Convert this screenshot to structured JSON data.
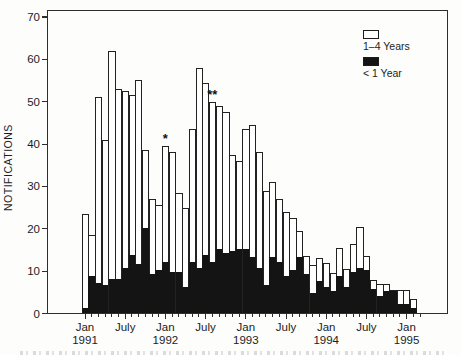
{
  "figure": {
    "background": "#fdfdfc"
  },
  "y_axis": {
    "label": "NOTIFICATIONS",
    "ticks": [
      0,
      10,
      20,
      30,
      40,
      50,
      60,
      70
    ],
    "min": 0,
    "max": 70
  },
  "x_axis": {
    "labeled_ticks": [
      {
        "index": 0,
        "line1": "Jan",
        "line2": "1991"
      },
      {
        "index": 6,
        "line1": "July",
        "line2": ""
      },
      {
        "index": 12,
        "line1": "Jan",
        "line2": "1992"
      },
      {
        "index": 18,
        "line1": "July",
        "line2": ""
      },
      {
        "index": 24,
        "line1": "Jan",
        "line2": "1993"
      },
      {
        "index": 30,
        "line1": "July",
        "line2": ""
      },
      {
        "index": 36,
        "line1": "Jan",
        "line2": "1994"
      },
      {
        "index": 42,
        "line1": "July",
        "line2": ""
      },
      {
        "index": 48,
        "line1": "Jan",
        "line2": "1995"
      }
    ]
  },
  "legend": [
    {
      "label": "1–4 Years",
      "color": "#ffffff"
    },
    {
      "label": "< 1 Year",
      "color": "#141414"
    }
  ],
  "chart_data": {
    "type": "bar",
    "stacked": true,
    "title": "",
    "xlabel": "",
    "ylabel": "NOTIFICATIONS",
    "ylim": [
      0,
      70
    ],
    "grid": false,
    "legend_position": "top-right",
    "x": [
      "Jan 1991",
      "Feb 1991",
      "Mar 1991",
      "Apr 1991",
      "May 1991",
      "Jun 1991",
      "Jul 1991",
      "Aug 1991",
      "Sep 1991",
      "Oct 1991",
      "Nov 1991",
      "Dec 1991",
      "Jan 1992",
      "Feb 1992",
      "Mar 1992",
      "Apr 1992",
      "May 1992",
      "Jun 1992",
      "Jul 1992",
      "Aug 1992",
      "Sep 1992",
      "Oct 1992",
      "Nov 1992",
      "Dec 1992",
      "Jan 1993",
      "Feb 1993",
      "Mar 1993",
      "Apr 1993",
      "May 1993",
      "Jun 1993",
      "Jul 1993",
      "Aug 1993",
      "Sep 1993",
      "Oct 1993",
      "Nov 1993",
      "Dec 1993",
      "Jan 1994",
      "Feb 1994",
      "Mar 1994",
      "Apr 1994",
      "May 1994",
      "Jun 1994",
      "Jul 1994",
      "Aug 1994",
      "Sep 1994",
      "Oct 1994",
      "Nov 1994",
      "Dec 1994",
      "Jan 1995",
      "Feb 1995"
    ],
    "series": [
      {
        "name": "< 1 Year",
        "values": [
          1,
          8.5,
          7,
          6.5,
          8,
          8,
          10.5,
          13.5,
          11.5,
          20,
          9,
          10,
          12,
          9.5,
          9.5,
          6,
          12,
          10.5,
          13.5,
          12,
          15,
          14,
          14.5,
          15,
          15,
          13,
          10.5,
          6.5,
          13,
          12,
          8.5,
          10,
          13,
          9,
          4.5,
          7.5,
          6,
          5,
          8.5,
          6,
          9.5,
          10.5,
          10,
          5.5,
          4,
          5,
          5,
          2,
          2,
          1
        ]
      },
      {
        "name": "1–4 Years",
        "values": [
          22.5,
          10,
          44,
          34.5,
          54,
          45,
          42,
          38,
          43.5,
          18.5,
          18,
          15.5,
          27.5,
          28.5,
          19,
          19,
          31.5,
          47.5,
          41,
          38,
          34,
          33.5,
          23,
          21,
          28.5,
          31.5,
          27.5,
          22.5,
          18,
          15,
          15.5,
          12.5,
          6.5,
          4.5,
          7,
          5.5,
          6,
          4.5,
          7,
          4.5,
          7,
          10,
          3.5,
          2.5,
          3,
          2,
          0.5,
          3.5,
          3.5,
          2.5
        ]
      }
    ],
    "totals": [
      23.5,
      18.5,
      51,
      41,
      62,
      53,
      52.5,
      51.5,
      55,
      38.5,
      27,
      25.5,
      39.5,
      38,
      28.5,
      25,
      43.5,
      58,
      54.5,
      50,
      49,
      47.5,
      37.5,
      36,
      43.5,
      44.5,
      38,
      29,
      31,
      27,
      24,
      22.5,
      19.5,
      13.5,
      11.5,
      13,
      12,
      9.5,
      15.5,
      10.5,
      16.5,
      20.5,
      13.5,
      8,
      7,
      7,
      5.5,
      5.5,
      5.5,
      3.5
    ],
    "markers": [
      {
        "month": "Jan 1992",
        "index": 12,
        "symbol": "*"
      },
      {
        "month": "Aug 1992",
        "index": 19,
        "symbol": "**"
      }
    ]
  }
}
